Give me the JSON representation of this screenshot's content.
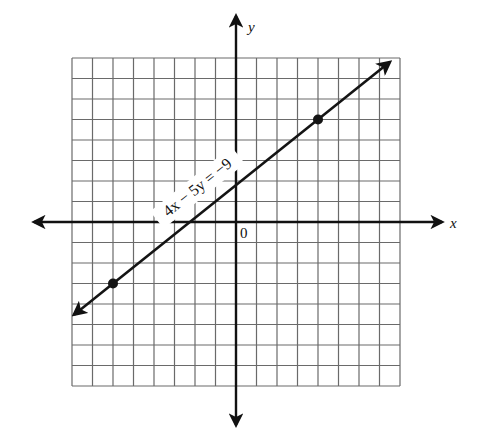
{
  "chart_data": {
    "type": "line",
    "title": "",
    "equation": "4x − 5y = −9",
    "xlabel": "x",
    "ylabel": "y",
    "origin_label": "0",
    "xlim": [
      -8,
      8
    ],
    "ylim": [
      -8,
      8
    ],
    "grid": true,
    "grid_step": 1,
    "series": [
      {
        "name": "4x − 5y = −9",
        "slope": 0.8,
        "intercept": 1.8,
        "x": [
          -7.9,
          7.5
        ],
        "y": [
          -4.52,
          7.8
        ],
        "arrows_both_ends": true
      }
    ],
    "points": [
      {
        "x": -6,
        "y": -3
      },
      {
        "x": 4,
        "y": 5
      }
    ],
    "intercepts": {
      "x": -2.25,
      "y": 1.8
    }
  },
  "labels": {
    "x_axis": "x",
    "y_axis": "y",
    "origin": "0",
    "equation": "4x − 5y = −9"
  },
  "colors": {
    "line": "#141414",
    "grid": "#6a6a6a",
    "background": "#ffffff"
  }
}
